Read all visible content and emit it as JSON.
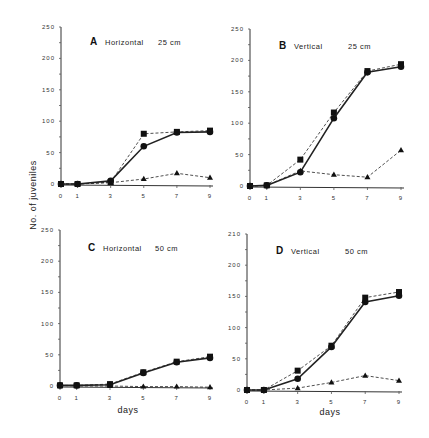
{
  "figure": {
    "ylabel": "No. of juveniles",
    "xlabel": "days"
  },
  "chart_data": [
    {
      "type": "line",
      "panel": "A",
      "title": "Horizontal 25 cm",
      "letter": "A",
      "subtitle": "Horizontal",
      "depth": "25 cm",
      "xlabel": "",
      "ylabel": "No. of juveniles",
      "x": [
        0,
        1,
        3,
        5,
        7,
        9
      ],
      "xticks": [
        "0",
        "1",
        "3",
        "5",
        "7",
        "9"
      ],
      "yticks": [
        "0",
        "50",
        "100",
        "150",
        "200",
        "250"
      ],
      "ylim": [
        0,
        250
      ],
      "series": [
        {
          "name": "square (dashed)",
          "marker": "square",
          "style": "dashed",
          "values": [
            0,
            0,
            3,
            80,
            83,
            85
          ]
        },
        {
          "name": "circle (solid)",
          "marker": "circle",
          "style": "solid",
          "values": [
            0,
            0,
            5,
            60,
            82,
            83
          ]
        },
        {
          "name": "triangle (dashed)",
          "marker": "triangle",
          "style": "dashed",
          "values": [
            0,
            0,
            2,
            8,
            17,
            10
          ]
        }
      ]
    },
    {
      "type": "line",
      "panel": "B",
      "title": "Vertical 25 cm",
      "letter": "B",
      "subtitle": "Vertical",
      "depth": "25 cm",
      "xlabel": "",
      "ylabel": "",
      "x": [
        0,
        1,
        3,
        5,
        7,
        9
      ],
      "xticks": [
        "0",
        "1",
        "3",
        "5",
        "7",
        "9"
      ],
      "yticks": [
        "0",
        "50",
        "100",
        "150",
        "200",
        "250"
      ],
      "ylim": [
        0,
        250
      ],
      "series": [
        {
          "name": "square (dashed)",
          "marker": "square",
          "style": "dashed",
          "values": [
            0,
            1,
            42,
            117,
            183,
            194
          ]
        },
        {
          "name": "circle (solid)",
          "marker": "circle",
          "style": "solid",
          "values": [
            0,
            1,
            22,
            108,
            181,
            190
          ]
        },
        {
          "name": "triangle (dashed)",
          "marker": "triangle",
          "style": "dashed",
          "values": [
            0,
            1,
            24,
            18,
            14,
            57
          ]
        }
      ]
    },
    {
      "type": "line",
      "panel": "C",
      "title": "Horizontal 50 cm",
      "letter": "C",
      "subtitle": "Horizontal",
      "depth": "50 cm",
      "xlabel": "days",
      "ylabel": "No. of juveniles",
      "x": [
        0,
        1,
        3,
        5,
        7,
        9
      ],
      "xticks": [
        "0",
        "1",
        "3",
        "5",
        "7",
        "9"
      ],
      "yticks": [
        "0",
        "50",
        "100",
        "150",
        "200",
        "250"
      ],
      "ylim": [
        0,
        250
      ],
      "series": [
        {
          "name": "square (dashed)",
          "marker": "square",
          "style": "dashed",
          "values": [
            1,
            1,
            3,
            22,
            39,
            47
          ]
        },
        {
          "name": "circle (solid)",
          "marker": "circle",
          "style": "solid",
          "values": [
            1,
            1,
            2,
            21,
            38,
            45
          ]
        },
        {
          "name": "triangle (dashed)",
          "marker": "triangle",
          "style": "dashed",
          "values": [
            1,
            0,
            0,
            -1,
            -1,
            -2
          ]
        }
      ]
    },
    {
      "type": "line",
      "panel": "D",
      "title": "Vertical 50 cm",
      "letter": "D",
      "subtitle": "Vertical",
      "depth": "50 cm",
      "xlabel": "days",
      "ylabel": "",
      "x": [
        0,
        1,
        3,
        5,
        7,
        9
      ],
      "xticks": [
        "0",
        "1",
        "3",
        "5",
        "7",
        "9"
      ],
      "yticks": [
        "0",
        "50",
        "100",
        "150",
        "200",
        "210"
      ],
      "ylim": [
        0,
        250
      ],
      "series": [
        {
          "name": "square (dashed)",
          "marker": "square",
          "style": "dashed",
          "values": [
            0,
            0,
            31,
            71,
            148,
            157
          ]
        },
        {
          "name": "circle (solid)",
          "marker": "circle",
          "style": "solid",
          "values": [
            0,
            0,
            18,
            69,
            141,
            151
          ]
        },
        {
          "name": "triangle (dashed)",
          "marker": "triangle",
          "style": "dashed",
          "values": [
            0,
            0,
            3,
            12,
            23,
            15
          ]
        }
      ]
    }
  ],
  "layout": {
    "panels": [
      {
        "x0": 61,
        "x9": 210,
        "y0": 184,
        "ytop": 27,
        "xticky": 193,
        "title_x": 90,
        "title_y": 45,
        "depth_x": 158
      },
      {
        "x0": 250,
        "x9": 401,
        "y0": 186,
        "ytop": 29,
        "xticky": 195,
        "title_x": 279,
        "title_y": 49,
        "depth_x": 348
      },
      {
        "x0": 60,
        "x9": 210,
        "y0": 386,
        "ytop": 230,
        "xticky": 395,
        "title_x": 88,
        "title_y": 251,
        "depth_x": 155
      },
      {
        "x0": 247,
        "x9": 399,
        "y0": 390,
        "ytop": 234,
        "xticky": 399,
        "title_x": 276,
        "title_y": 254,
        "depth_x": 345
      }
    ],
    "ylabel_pos": {
      "x": 36,
      "y": 195
    },
    "xlabel_pos": [
      {
        "x": 128,
        "y": 413
      },
      {
        "x": 330,
        "y": 415
      }
    ]
  }
}
